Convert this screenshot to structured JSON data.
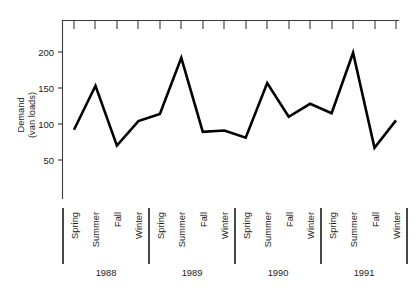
{
  "chart_data": {
    "type": "line",
    "title": "",
    "xlabel": "",
    "ylabel": "Demand\n(van loads)",
    "ylabel_line1": "Demand",
    "ylabel_line2": "(van loads)",
    "ylim": [
      0,
      225
    ],
    "ytick_values": [
      50,
      100,
      150,
      200
    ],
    "ytick_labels": [
      "50",
      "100",
      "150",
      "200"
    ],
    "grid": false,
    "legend": "none",
    "categories": [
      "Spring",
      "Summer",
      "Fall",
      "Winter",
      "Spring",
      "Summer",
      "Fall",
      "Winter",
      "Spring",
      "Summer",
      "Fall",
      "Winter",
      "Spring",
      "Summer",
      "Fall",
      "Winter"
    ],
    "values": [
      92,
      153,
      70,
      104,
      114,
      192,
      89,
      91,
      81,
      157,
      110,
      128,
      115,
      199,
      67,
      105
    ],
    "groups": [
      {
        "year": "1988",
        "seasons": [
          "Spring",
          "Summer",
          "Fall",
          "Winter"
        ],
        "values": [
          92,
          153,
          70,
          104
        ]
      },
      {
        "year": "1989",
        "seasons": [
          "Spring",
          "Summer",
          "Fall",
          "Winter"
        ],
        "values": [
          114,
          192,
          89,
          91
        ]
      },
      {
        "year": "1990",
        "seasons": [
          "Spring",
          "Summer",
          "Fall",
          "Winter"
        ],
        "values": [
          81,
          157,
          110,
          128
        ]
      },
      {
        "year": "1991",
        "seasons": [
          "Spring",
          "Summer",
          "Fall",
          "Winter"
        ],
        "values": [
          115,
          199,
          67,
          105
        ]
      }
    ],
    "year_labels": [
      "1988",
      "1989",
      "1990",
      "1991"
    ],
    "series_color": "#000000",
    "axis_color": "#3a3a3a"
  },
  "axis": {
    "ytick_0": "50",
    "ytick_1": "100",
    "ytick_2": "150",
    "ytick_3": "200",
    "ylabel_line1": "Demand",
    "ylabel_line2": "(van loads)"
  },
  "seasons": {
    "s0": "Spring",
    "s1": "Summer",
    "s2": "Fall",
    "s3": "Winter",
    "s4": "Spring",
    "s5": "Summer",
    "s6": "Fall",
    "s7": "Winter",
    "s8": "Spring",
    "s9": "Summer",
    "s10": "Fall",
    "s11": "Winter",
    "s12": "Spring",
    "s13": "Summer",
    "s14": "Fall",
    "s15": "Winter"
  },
  "years": {
    "y0": "1988",
    "y1": "1989",
    "y2": "1990",
    "y3": "1991"
  }
}
